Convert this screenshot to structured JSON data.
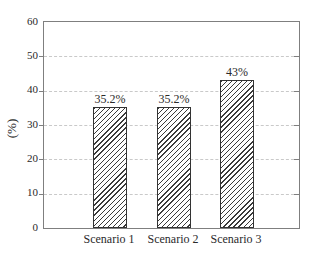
{
  "colors": {
    "background": "#ffffff",
    "frame": "#7f7f7f",
    "grid": "#c9c9c9",
    "text": "#2a2a2a",
    "bar_border": "#333333",
    "bar_hatch": "#3a3a3a",
    "bar_fill": "#ffffff"
  },
  "chart_data": {
    "type": "bar",
    "title": "",
    "categories": [
      "Scenario 1",
      "Scenario 2",
      "Scenario 3"
    ],
    "values": [
      35.2,
      35.2,
      43
    ],
    "bar_labels": [
      "35.2%",
      "35.2%",
      "43%"
    ],
    "xlabel": "",
    "ylabel": "(%)",
    "ylim": [
      0,
      60
    ],
    "yticks": [
      0,
      10,
      20,
      30,
      40,
      50,
      60
    ],
    "grid": {
      "horizontal": true,
      "style": "dashed",
      "at": [
        10,
        20,
        30,
        40,
        50
      ]
    },
    "legend": {
      "visible": false
    },
    "bar_style": {
      "hatch": "/",
      "fill": "white",
      "outline": "dark-gray"
    }
  }
}
